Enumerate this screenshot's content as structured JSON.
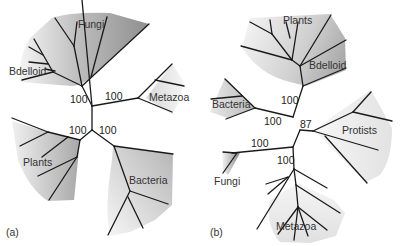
{
  "figure": {
    "panels": [
      {
        "id": "a",
        "label": "(a)",
        "clades": [
          "Fungi",
          "Bdelloid",
          "Metazoa",
          "Plants",
          "Bacteria"
        ],
        "bootstrap": [
          "100",
          "100",
          "100",
          "100"
        ]
      },
      {
        "id": "b",
        "label": "(b)",
        "clades": [
          "Plants",
          "Bdelloid",
          "Bacteria",
          "Protists",
          "Fungi",
          "Metazoa"
        ],
        "bootstrap": [
          "100",
          "100",
          "87",
          "100",
          "100"
        ]
      }
    ]
  },
  "colors": {
    "branch": "#1a1a1a",
    "shade_dark": "#9a9a9a",
    "shade_light": "#f2f2f2",
    "text": "#333333"
  }
}
